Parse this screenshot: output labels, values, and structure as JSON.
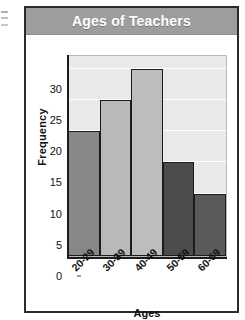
{
  "figure": {
    "title": "Ages of Teachers",
    "title_bar_color": "#9d9d9d",
    "title_text_color": "#ffffff",
    "frame_color": "#2b2b2b"
  },
  "chart_data": {
    "type": "bar",
    "title": "Ages of Teachers",
    "subtitle": "",
    "xlabel": "Ages",
    "ylabel": "Frequency",
    "categories": [
      "20-29",
      "30-39",
      "40-49",
      "50-59",
      "60-69"
    ],
    "values": [
      20,
      25,
      30,
      15,
      10
    ],
    "bar_colors": [
      "#878787",
      "#b9b9b9",
      "#bdbdbd",
      "#4c4c4c",
      "#5a5a5a"
    ],
    "bar_border_color": "#1c1c1c",
    "ylim": [
      0,
      32
    ],
    "yticks": [
      0,
      5,
      10,
      15,
      20,
      25,
      30
    ],
    "ytick_labels": [
      "0",
      "5",
      "10",
      "15",
      "20",
      "25",
      "30"
    ],
    "grid": true,
    "gridline_color": "#ffffff",
    "plot_background": "#e9e9e9",
    "legend": false,
    "xtick_rotation": -45
  }
}
